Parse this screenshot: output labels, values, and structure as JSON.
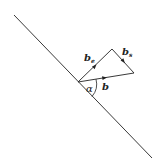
{
  "diagram": {
    "type": "vector-decomposition",
    "line": {
      "from": [
        14,
        15
      ],
      "to": [
        152,
        158
      ]
    },
    "vertices": {
      "origin": [
        78,
        82
      ],
      "top": [
        112,
        49
      ],
      "right": [
        134,
        73
      ]
    },
    "labels": {
      "b_e": {
        "base": "b",
        "sub": "e"
      },
      "b_s": {
        "base": "b",
        "sub": "s"
      },
      "b": "b",
      "alpha": "α"
    },
    "colors": {
      "stroke": "#222222",
      "background": "#ffffff"
    }
  }
}
